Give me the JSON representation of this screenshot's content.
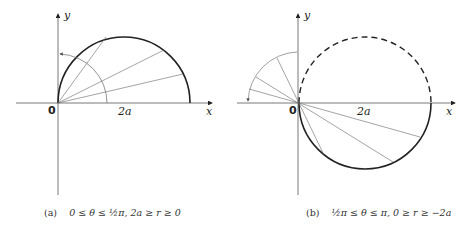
{
  "figures": [
    {
      "id": "a",
      "caption_tag": "(a)",
      "caption_text": "0 ≤ θ ≤ ½π, 2a ≥ r ≥ 0",
      "axis_x_label": "x",
      "axis_y_label": "y",
      "origin_label": "0",
      "tick_label": "2a",
      "curve": "upper semicircle r = 4a cos θ traced solid",
      "rays": 4
    },
    {
      "id": "b",
      "caption_tag": "(b)",
      "caption_text": "½π ≤ θ ≤ π, 0 ≥ r ≥ −2a",
      "axis_x_label": "x",
      "axis_y_label": "y",
      "origin_label": "0",
      "tick_label": "2a",
      "curve": "lower semicircle solid, upper semicircle dashed",
      "rays": 3
    }
  ],
  "colors": {
    "stroke": "#222222",
    "thin": "#666666"
  }
}
